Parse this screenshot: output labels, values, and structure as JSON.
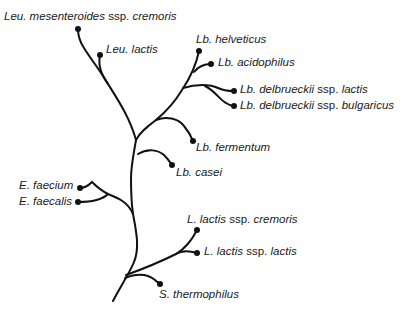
{
  "diagram": {
    "type": "phylogenetic-tree",
    "line_color": "#111111",
    "text_color": "#1a1a1a",
    "taxa": [
      {
        "id": "leu-mesenteroides",
        "parts": [
          {
            "t": "Leu. mesenteroides",
            "it": true
          },
          {
            "t": " ssp. ",
            "it": false
          },
          {
            "t": "cremoris",
            "it": true
          }
        ],
        "label_x": 4,
        "label_y": 11,
        "dot": [
          78,
          29
        ]
      },
      {
        "id": "leu-lactis",
        "parts": [
          {
            "t": "Leu. lactis",
            "it": true
          }
        ],
        "label_x": 106,
        "label_y": 44,
        "dot": [
          100,
          55
        ]
      },
      {
        "id": "lb-helveticus",
        "parts": [
          {
            "t": "Lb. helveticus",
            "it": true
          }
        ],
        "label_x": 196,
        "label_y": 34,
        "dot": [
          199,
          51
        ]
      },
      {
        "id": "lb-acidophilus",
        "parts": [
          {
            "t": "Lb. acidophilus",
            "it": true
          }
        ],
        "label_x": 218,
        "label_y": 57,
        "dot": [
          211,
          64
        ]
      },
      {
        "id": "lb-delbrueckii-lactis",
        "parts": [
          {
            "t": "Lb. delbrueckii",
            "it": true
          },
          {
            "t": " ssp. ",
            "it": false
          },
          {
            "t": "lactis",
            "it": true
          }
        ],
        "label_x": 240,
        "label_y": 84,
        "dot": [
          234,
          91
        ]
      },
      {
        "id": "lb-delbrueckii-bulgaricus",
        "parts": [
          {
            "t": "Lb. delbrueckii",
            "it": true
          },
          {
            "t": " ssp. ",
            "it": false
          },
          {
            "t": "bulgaricus",
            "it": true
          }
        ],
        "label_x": 240,
        "label_y": 100,
        "dot": [
          234,
          106
        ]
      },
      {
        "id": "lb-fermentum",
        "parts": [
          {
            "t": "Lb. fermentum",
            "it": true
          }
        ],
        "label_x": 196,
        "label_y": 142,
        "dot": [
          193,
          141
        ]
      },
      {
        "id": "lb-casei",
        "parts": [
          {
            "t": "Lb. casei",
            "it": true
          }
        ],
        "label_x": 176,
        "label_y": 167,
        "dot": [
          172,
          165
        ]
      },
      {
        "id": "e-faecium",
        "parts": [
          {
            "t": "E. faecium",
            "it": true
          }
        ],
        "label_x": 19,
        "label_y": 180,
        "dot": [
          80,
          188
        ]
      },
      {
        "id": "e-faecalis",
        "parts": [
          {
            "t": "E. faecalis",
            "it": true
          }
        ],
        "label_x": 19,
        "label_y": 196,
        "dot": [
          78,
          202
        ]
      },
      {
        "id": "l-lactis-cremoris",
        "parts": [
          {
            "t": "L. lactis",
            "it": true
          },
          {
            "t": " ssp. ",
            "it": false
          },
          {
            "t": "cremoris",
            "it": true
          }
        ],
        "label_x": 187,
        "label_y": 214,
        "dot": [
          197,
          230
        ]
      },
      {
        "id": "l-lactis-lactis",
        "parts": [
          {
            "t": "L. lactis",
            "it": true
          },
          {
            "t": " ssp. ",
            "it": false
          },
          {
            "t": "lactis",
            "it": true
          }
        ],
        "label_x": 204,
        "label_y": 246,
        "dot": [
          197,
          253
        ]
      },
      {
        "id": "s-thermophilus",
        "parts": [
          {
            "t": "S. thermophilus",
            "it": true
          }
        ],
        "label_x": 159,
        "label_y": 289,
        "dot": [
          160,
          284
        ]
      }
    ],
    "branches": [
      "M113,301 C122,284 130,272 134,262 C140,248 136,230 133,214 C131,200 131,190 131,178 C131,166 134,152 136,140",
      "M136,140 C130,118 118,100 108,84 C100,70 90,58 84,48 C80,42 78,36 78,29",
      "M108,84 C101,74 98,66 100,55",
      "M136,140 C140,132 148,126 156,120 C168,110 176,100 182,90 C190,78 196,66 199,51",
      "M194,72 C198,67 204,64 211,64",
      "M183,88 C196,84 210,84 218,88 C224,91 228,91 234,91",
      "M205,86 C214,90 220,100 226,103 C229,105 231,106 234,106",
      "M156,120 C166,116 178,118 184,126 C189,132 191,136 193,141",
      "M138,154 C148,148 158,150 164,155 C168,159 170,162 172,165",
      "M133,212 C128,200 116,196 106,192 C98,188 94,182 86,180 C83,181 81,185 80,188",
      "M103,189 C96,186 88,180 82,200 C80,201 79,202 78,202",
      "M126,275 C140,270 160,262 176,254 C186,248 192,240 197,230",
      "M176,254 C182,250 190,251 197,253",
      "M125,278 C140,272 150,276 155,280 C157,282 159,283 160,284"
    ]
  }
}
